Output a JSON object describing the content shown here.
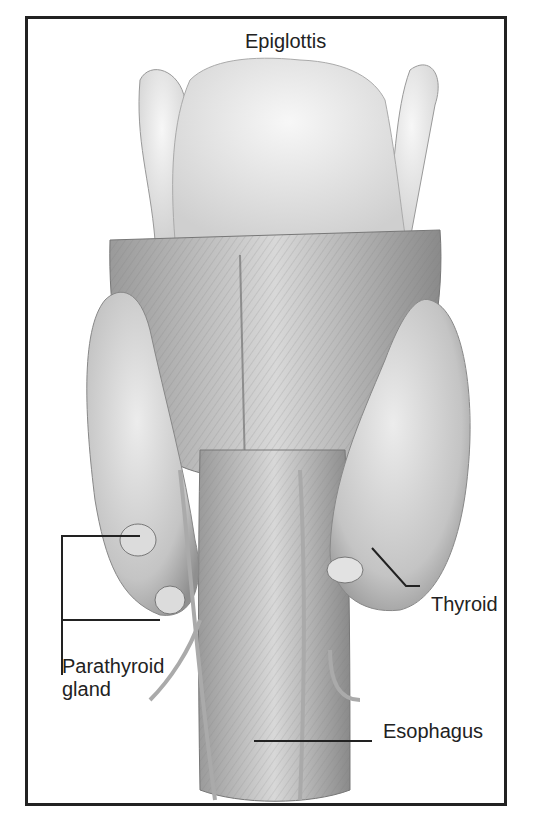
{
  "figure": {
    "type": "anatomical-illustration",
    "labels": {
      "epiglottis": "Epiglottis",
      "thyroid": "Thyroid",
      "parathyroid_line1": "Parathyroid",
      "parathyroid_line2": "gland",
      "esophagus": "Esophagus"
    },
    "colors": {
      "frame": "#222222",
      "tissue_light": "#e6e6e6",
      "tissue_mid": "#b5b5b5",
      "tissue_dark": "#7a7a7a",
      "leader": "#222222"
    }
  }
}
